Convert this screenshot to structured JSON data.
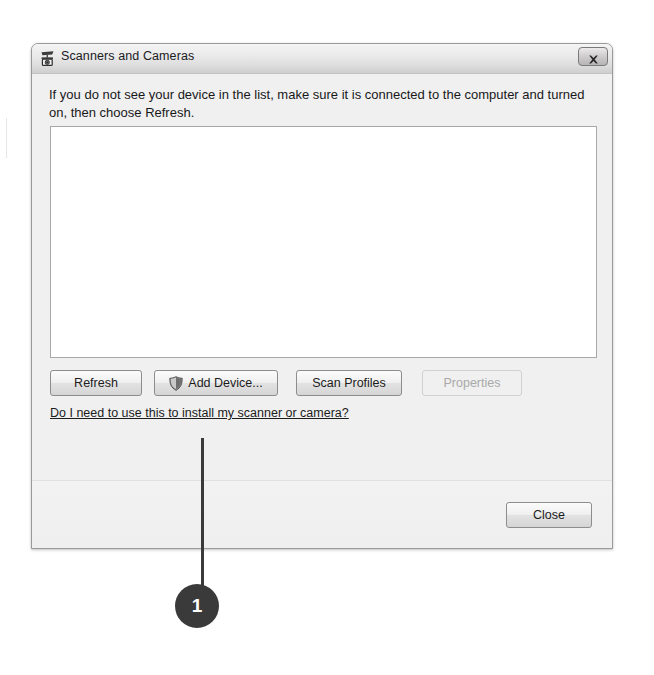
{
  "window": {
    "title": "Scanners and Cameras",
    "title_icon": "scanner-camera-icon",
    "close_button_icon": "close-x-icon",
    "close_button_label": "Close"
  },
  "content": {
    "instruction": "If you do not see your device in the list, make sure it is connected to the computer and turned on, then choose Refresh.",
    "device_list": {
      "name": "device-list",
      "items": [],
      "empty": true
    },
    "buttons": [
      {
        "id": "refresh",
        "label": "Refresh",
        "icon": null,
        "enabled": true
      },
      {
        "id": "add-device",
        "label": "Add Device...",
        "icon": "uac-shield-icon",
        "enabled": true
      },
      {
        "id": "scan-profiles",
        "label": "Scan Profiles",
        "icon": null,
        "enabled": true
      },
      {
        "id": "properties",
        "label": "Properties",
        "icon": null,
        "enabled": false
      }
    ],
    "help_link": "Do I need to use this to install my scanner or camera?"
  },
  "footer": {
    "close_label": "Close"
  },
  "annotation": {
    "callout_number": "1",
    "target": "add-device-button"
  },
  "colors": {
    "callout": "#3a3a3a",
    "titlebar_top": "#f4f4f4",
    "titlebar_bottom": "#cfcfcf",
    "dialog_background": "#f0f0f0",
    "list_background": "#ffffff",
    "disabled_text": "#a9a9a9"
  }
}
